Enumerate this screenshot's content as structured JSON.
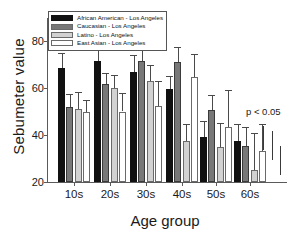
{
  "chart_data": {
    "type": "bar",
    "title": "",
    "xlabel": "Age group",
    "ylabel": "Sebumeter value",
    "ylim": [
      20,
      88
    ],
    "yticks": [
      20,
      40,
      60,
      80
    ],
    "grid": false,
    "legend_position": "top-left",
    "categories": [
      "10s",
      "20s",
      "30s",
      "40s",
      "50s",
      "60s"
    ],
    "annotations": [
      {
        "text": "p < 0.05",
        "x": "60s",
        "y": 50
      }
    ],
    "series": [
      {
        "name": "African American - Los Angeles",
        "color": "#111111",
        "values": [
          68.5,
          71.5,
          67.0,
          59.5,
          39.0,
          37.5
        ],
        "errors_upper": [
          75.0,
          77.0,
          74.0,
          65.0,
          46.0,
          44.5
        ]
      },
      {
        "name": "Caucasian - Los Angeles",
        "color": "#787878",
        "values": [
          52.0,
          61.5,
          71.5,
          71.0,
          50.5,
          35.5
        ],
        "errors_upper": [
          57.5,
          66.5,
          77.0,
          77.5,
          57.0,
          43.5
        ]
      },
      {
        "name": "Latino - Los Angeles",
        "color": "#d2d2d2",
        "values": [
          51.0,
          60.0,
          63.0,
          37.5,
          35.0,
          25.0
        ],
        "errors_upper": [
          58.5,
          65.5,
          70.0,
          44.5,
          45.0,
          41.0
        ]
      },
      {
        "name": "East Asian - Los Angeles",
        "color": "#ffffff",
        "values": [
          50.0,
          50.0,
          52.5,
          64.5,
          43.5,
          33.0
        ],
        "errors_upper": [
          55.0,
          58.0,
          63.0,
          74.5,
          59.0,
          44.5
        ]
      }
    ],
    "extra_markers": [
      {
        "top": 44.0,
        "bottom": 33.5
      },
      {
        "top": 41.5,
        "bottom": 29.5
      },
      {
        "top": 35.5,
        "bottom": 23.0
      }
    ]
  },
  "legend": {
    "items": [
      {
        "label": "African American - Los Angeles",
        "swatch": "#111111"
      },
      {
        "label": "Caucasian - Los Angeles",
        "swatch": "#787878"
      },
      {
        "label": "Latino - Los Angeles",
        "swatch": "#d2d2d2"
      },
      {
        "label": "East Asian - Los Angeles",
        "swatch": "#ffffff"
      }
    ]
  },
  "axes": {
    "y_title": "Sebumeter value",
    "x_title": "Age group",
    "y_tick_labels": [
      "20",
      "40",
      "60",
      "80"
    ],
    "x_tick_labels": [
      "10s",
      "20s",
      "30s",
      "40s",
      "50s",
      "60s"
    ]
  },
  "annotation": {
    "pvalue": "p < 0.05"
  }
}
